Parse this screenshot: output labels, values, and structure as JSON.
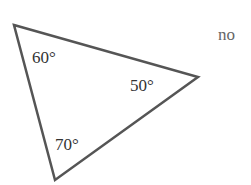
{
  "diagram": {
    "type": "triangle",
    "stroke_color": "#555555",
    "vertices": [
      {
        "id": "top-left",
        "x": 14,
        "y": 25
      },
      {
        "id": "right",
        "x": 198,
        "y": 77
      },
      {
        "id": "bottom",
        "x": 55,
        "y": 180
      }
    ],
    "angles": [
      {
        "vertex": "top-left",
        "label": "60°"
      },
      {
        "vertex": "right",
        "label": "50°"
      },
      {
        "vertex": "bottom",
        "label": "70°"
      }
    ]
  },
  "answer": "no"
}
